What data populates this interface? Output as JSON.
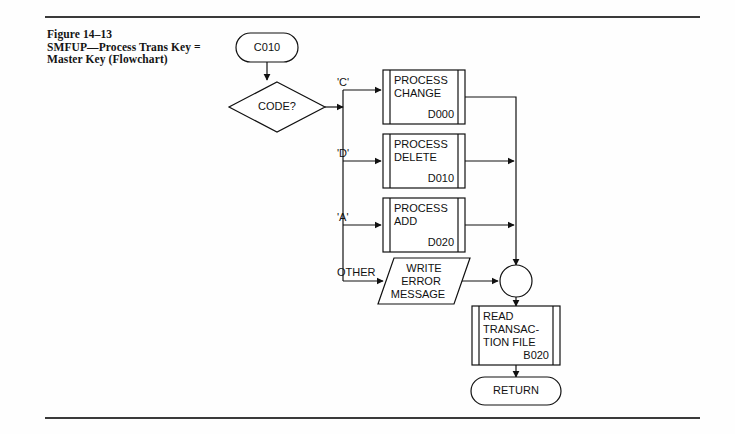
{
  "figure": {
    "caption_lines": [
      "Figure 14–13",
      "SMFUP—Process Trans Key =",
      "Master Key (Flowchart)"
    ]
  },
  "flowchart": {
    "start_terminal": {
      "label": "C010"
    },
    "decision": {
      "label": "CODE?"
    },
    "branches": [
      {
        "label": "'C'"
      },
      {
        "label": "'D'"
      },
      {
        "label": "'A'"
      },
      {
        "label": "OTHER"
      }
    ],
    "processes": [
      {
        "title_line1": "PROCESS",
        "title_line2": "CHANGE",
        "ref": "D000"
      },
      {
        "title_line1": "PROCESS",
        "title_line2": "DELETE",
        "ref": "D010"
      },
      {
        "title_line1": "PROCESS",
        "title_line2": "ADD",
        "ref": "D020"
      }
    ],
    "io_shape": {
      "line1": "WRITE",
      "line2": "ERROR",
      "line3": "MESSAGE"
    },
    "connector": {
      "label": ""
    },
    "read_process": {
      "line1": "READ",
      "line2": "TRANSAC-",
      "line3": "TION FILE",
      "ref": "B020"
    },
    "end_terminal": {
      "label": "RETURN"
    }
  },
  "colors": {
    "ink": "#111111",
    "rule": "#3a3a3a",
    "page": "#fefefe"
  }
}
